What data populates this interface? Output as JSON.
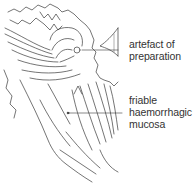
{
  "figure": {
    "type": "anatomical line drawing",
    "labels": [
      {
        "id": "artefact",
        "lines": [
          "artefact of",
          "preparation"
        ]
      },
      {
        "id": "mucosa",
        "lines": [
          "friable",
          "haemorrhagic",
          "mucosa"
        ]
      }
    ],
    "colors": {
      "line": "#3a3a3a",
      "text": "#333333",
      "background": "#ffffff"
    }
  }
}
